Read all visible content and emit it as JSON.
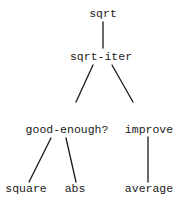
{
  "diagram": {
    "type": "call-tree",
    "colors": {
      "line": "#1a1a1a",
      "text": "#1a1a1a",
      "background": "#ffffff"
    },
    "nodes": {
      "sqrt": {
        "label": "sqrt",
        "x": 103,
        "y": 14
      },
      "sqrt_iter": {
        "label": "sqrt-iter",
        "x": 101,
        "y": 57
      },
      "good_enough": {
        "label": "good-enough?",
        "x": 67,
        "y": 130
      },
      "improve": {
        "label": "improve",
        "x": 149,
        "y": 130
      },
      "square": {
        "label": "square",
        "x": 26,
        "y": 189
      },
      "abs": {
        "label": "abs",
        "x": 75,
        "y": 189
      },
      "average": {
        "label": "average",
        "x": 149,
        "y": 189
      }
    },
    "edges": [
      {
        "from": "sqrt",
        "to": "sqrt-iter"
      },
      {
        "from": "sqrt-iter",
        "to": "good-enough?"
      },
      {
        "from": "sqrt-iter",
        "to": "improve"
      },
      {
        "from": "good-enough?",
        "to": "square"
      },
      {
        "from": "good-enough?",
        "to": "abs"
      },
      {
        "from": "improve",
        "to": "average"
      }
    ]
  }
}
